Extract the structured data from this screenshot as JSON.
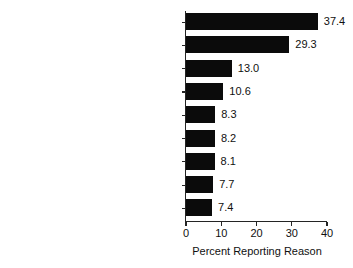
{
  "chart_data": {
    "type": "bar",
    "orientation": "horizontal",
    "title": "",
    "xlabel": "Percent Reporting Reason",
    "ylabel": "",
    "xlim": [
      0,
      40
    ],
    "xticks": [
      0,
      10,
      20,
      30,
      40
    ],
    "xtick_labels": [
      "0",
      "10",
      "20",
      "30",
      "40"
    ],
    "grid": false,
    "legend": null,
    "bar_color": "#0b0b0b",
    "categories": [
      "No health coverage and could\nnot afford cost",
      "Not ready to stop using",
      "Able to handle problem\nwithout treatment",
      "No transportation/inconvenient",
      "No program having type of treatment",
      "Did not feel need for treatment\nat the time",
      "Did not know where to go\nfor treatment",
      "Might cause neighbors/community\nto have negative opinion",
      "Might have negative effect on job"
    ],
    "values": [
      37.4,
      29.3,
      13.0,
      10.6,
      8.3,
      8.2,
      8.1,
      7.7,
      7.4
    ],
    "value_labels": [
      "37.4",
      "29.3",
      "13.0",
      "10.6",
      "8.3",
      "8.2",
      "8.1",
      "7.7",
      "7.4"
    ]
  }
}
